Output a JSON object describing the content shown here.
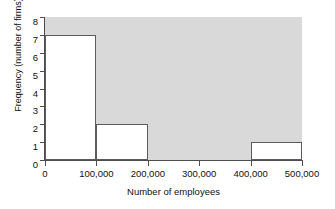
{
  "chart_data": {
    "type": "bar",
    "title": "",
    "subtitle": "",
    "xlabel": "Number of employees",
    "ylabel": "Frequency (number of firms)",
    "xlim": [
      0,
      500000
    ],
    "ylim": [
      0,
      8
    ],
    "grid": false,
    "legend": null,
    "bin_width": 100000,
    "x_tick_labels": [
      "0",
      "100,000",
      "200,000",
      "300,000",
      "400,000",
      "500,000"
    ],
    "x_tick_values": [
      0,
      100000,
      200000,
      300000,
      400000,
      500000
    ],
    "y_tick_labels": [
      "0",
      "1",
      "2",
      "3",
      "4",
      "5",
      "6",
      "7",
      "8"
    ],
    "y_tick_values": [
      0,
      1,
      2,
      3,
      4,
      5,
      6,
      7,
      8
    ],
    "bins": [
      {
        "label": "0-100,000",
        "start": 0,
        "end": 100000,
        "value": 7
      },
      {
        "label": "100,000-200,000",
        "start": 100000,
        "end": 200000,
        "value": 2
      },
      {
        "label": "200,000-300,000",
        "start": 200000,
        "end": 300000,
        "value": 0
      },
      {
        "label": "300,000-400,000",
        "start": 300000,
        "end": 400000,
        "value": 0
      },
      {
        "label": "400,000-500,000",
        "start": 400000,
        "end": 500000,
        "value": 1
      }
    ],
    "categories": [
      "0-100,000",
      "100,000-200,000",
      "200,000-300,000",
      "300,000-400,000",
      "400,000-500,000"
    ],
    "values": [
      7,
      2,
      0,
      0,
      1
    ],
    "colors": {
      "plot_background": "#d9d9d9",
      "bar_fill": "#ffffff",
      "bar_outline": "#5c5c5c",
      "axis": "#4d4d4d",
      "text": "#111111",
      "page_background": "#ffffff"
    }
  }
}
